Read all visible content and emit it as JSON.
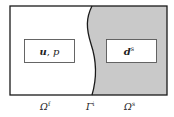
{
  "colors": {
    "fluid_fill": "#ffffff",
    "solid_fill": "#c9c9c9",
    "stroke": "#1a1a1a",
    "box_stroke": "#555555"
  },
  "fluid_domain": {
    "variables": {
      "bold": "u",
      "sep": ", ",
      "plain": "p"
    },
    "label": {
      "base": "Ω",
      "sup": "f"
    }
  },
  "interface": {
    "label": {
      "base": "Γ",
      "sup": "i"
    }
  },
  "solid_domain": {
    "variables": {
      "bold": "d",
      "sup": "s"
    },
    "label": {
      "base": "Ω",
      "sup": "s"
    }
  }
}
